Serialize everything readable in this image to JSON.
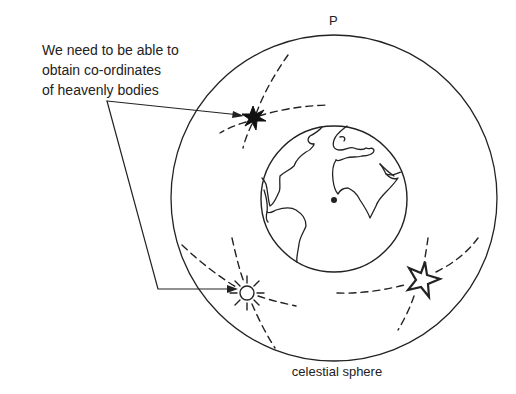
{
  "caption": {
    "lines": [
      "We need to be able to",
      "obtain  co-ordinates",
      "of heavenly bodies"
    ]
  },
  "labels": {
    "pole": "P",
    "sphere": "celestial sphere"
  },
  "colors": {
    "ink": "#222222",
    "background": "#ffffff"
  },
  "elements": {
    "celestial_sphere": {
      "cx": 334,
      "cy": 198,
      "r": 163
    },
    "earth": {
      "cx": 334,
      "cy": 199,
      "r": 73,
      "observer_dot": [
        334,
        200
      ]
    },
    "bodies": [
      {
        "name": "filled-star",
        "x": 253,
        "y": 118
      },
      {
        "name": "sun",
        "x": 247,
        "y": 293
      },
      {
        "name": "outline-star",
        "x": 422,
        "y": 280
      }
    ]
  }
}
